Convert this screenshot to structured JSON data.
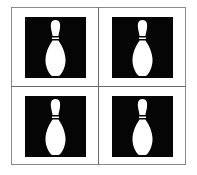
{
  "grid": {
    "rows": 2,
    "cols": 2
  },
  "tiles": [
    {
      "icon": "bowling-pin-icon",
      "background": "#050505",
      "color": "#ffffff"
    },
    {
      "icon": "bowling-pin-icon",
      "background": "#050505",
      "color": "#ffffff"
    },
    {
      "icon": "bowling-pin-icon",
      "background": "#050505",
      "color": "#ffffff"
    },
    {
      "icon": "bowling-pin-icon",
      "background": "#050505",
      "color": "#ffffff"
    }
  ]
}
